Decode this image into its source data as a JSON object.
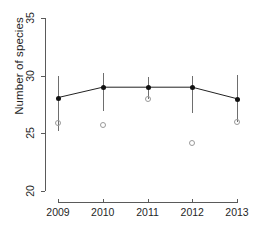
{
  "chart_data": {
    "type": "line",
    "title": "",
    "xlabel": "",
    "ylabel": "Number of species",
    "categories": [
      "2009",
      "2010",
      "2011",
      "2012",
      "2013"
    ],
    "xtick_labels": [
      "2009",
      "2010",
      "2011",
      "2012",
      "2013"
    ],
    "ytick_labels": [
      "20",
      "25",
      "30",
      "35"
    ],
    "ytick_values": [
      20,
      25,
      30,
      35
    ],
    "ylim": [
      20,
      35
    ],
    "grid": false,
    "legend": null,
    "series": [
      {
        "name": "mean number of species",
        "marker": "filled-circle",
        "color": "#111111",
        "values": [
          28.1,
          29.0,
          29.0,
          29.0,
          28.0
        ],
        "error_low": [
          25.2,
          26.9,
          28.0,
          26.8,
          26.0
        ],
        "error_high": [
          30.0,
          30.2,
          29.9,
          30.0,
          30.1
        ]
      },
      {
        "name": "observed values",
        "marker": "open-circle",
        "color": "#9a9a9a",
        "values": [
          25.9,
          25.7,
          28.0,
          24.2,
          26.0
        ]
      }
    ]
  },
  "axis": {
    "y_label": "Number of species"
  }
}
